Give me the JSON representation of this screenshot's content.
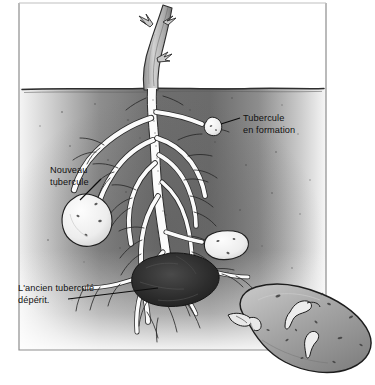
{
  "figure": {
    "language": "fr",
    "frame": {
      "stroke_color": "#8d8d8d",
      "background_color": "#ffffff"
    },
    "soil": {
      "name": "soil-block",
      "surface_label": "ligne de sol",
      "color_dark": "#6f6f6f",
      "color_mid": "#8a8a8a",
      "color_light": "#d8d8d8",
      "surface_line_color": "#3a3a3a"
    },
    "plant": {
      "stem_color": "#b9b9b9",
      "root_color": "#fdfdfd",
      "root_outline": "#2b2b2b"
    },
    "tubers": [
      {
        "id": "tuber-forming",
        "label_ref": "callout-0",
        "fill": "#eeeeee"
      },
      {
        "id": "tuber-new-large",
        "label_ref": "callout-1",
        "fill": "#f2f2f2"
      },
      {
        "id": "tuber-new-right",
        "label_ref": null,
        "fill": "#eeeeee"
      },
      {
        "id": "tuber-old-withering",
        "label_ref": "callout-2",
        "fill": "#2f2f2f"
      },
      {
        "id": "potato-inset",
        "label_ref": null,
        "fill": "#9a9a9a"
      }
    ],
    "callouts": [
      {
        "id": "callout-0",
        "name": "callout-tubercule-en-formation",
        "lines": [
          "Tubercule",
          "en formation"
        ],
        "text_x": 243,
        "text_y": 121,
        "line_height": 11.5,
        "leader": {
          "x1": 240,
          "y1": 118,
          "x2": 221,
          "y2": 124
        }
      },
      {
        "id": "callout-1",
        "name": "callout-nouveau-tubercule",
        "lines": [
          "Nouveau",
          "tubercule"
        ],
        "text_x": 50,
        "text_y": 173,
        "line_height": 11.5,
        "leader": {
          "x1": 101,
          "y1": 179,
          "x2": 80,
          "y2": 200
        }
      },
      {
        "id": "callout-2",
        "name": "callout-ancien-tubercule",
        "lines": [
          "L'ancien tuberculé",
          "dépérit."
        ],
        "text_x": 18,
        "text_y": 291,
        "line_height": 11.5,
        "leader": {
          "x1": 68,
          "y1": 299,
          "x2": 158,
          "y2": 288
        }
      }
    ]
  }
}
